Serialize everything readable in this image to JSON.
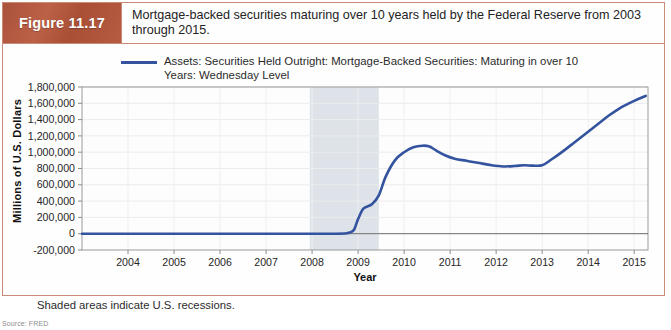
{
  "figure": {
    "badge_label": "Figure 11.17",
    "caption": "Mortgage-backed securities maturing over 10 years held by the Federal Reserve from 2003 through 2015.",
    "note": "Shaded areas indicate U.S. recessions.",
    "source": "Source: FRED",
    "accent_color": "#b0563c",
    "border_color": "#c98a78"
  },
  "chart_data": {
    "type": "line",
    "title": "",
    "xlabel": "Year",
    "ylabel": "Millions of U.S. Dollars",
    "legend": [
      "Assets: Securities Held Outright: Mortgage-Backed Securities: Maturing in over 10 Years: Wednesday Level"
    ],
    "legend_position": "top",
    "grid": true,
    "series_color": "#33539e",
    "xlim": [
      2003.0,
      2015.3
    ],
    "ylim": [
      -200000,
      1800000
    ],
    "ytick_step": 200000,
    "yticks": [
      1800000,
      1600000,
      1400000,
      1200000,
      1000000,
      800000,
      600000,
      400000,
      200000,
      0,
      -200000
    ],
    "ytick_labels": [
      "1,800,000",
      "1,600,000",
      "1,400,000",
      "1,200,000",
      "1,000,000",
      "800,000",
      "600,000",
      "400,000",
      "200,000",
      "0",
      "-200,000"
    ],
    "xticks": [
      2004,
      2005,
      2006,
      2007,
      2008,
      2009,
      2010,
      2011,
      2012,
      2013,
      2014,
      2015
    ],
    "xtick_labels": [
      "2004",
      "2005",
      "2006",
      "2007",
      "2008",
      "2009",
      "2010",
      "2011",
      "2012",
      "2013",
      "2014",
      "2015"
    ],
    "shaded_regions": [
      {
        "label": "U.S. recession",
        "x0": 2007.95,
        "x1": 2009.45,
        "color": "#dde3e8"
      }
    ],
    "series": [
      {
        "name": "Assets: Securities Held Outright: Mortgage-Backed Securities: Maturing in over 10 Years: Wednesday Level",
        "x": [
          2003.0,
          2004.0,
          2005.0,
          2006.0,
          2007.0,
          2008.0,
          2008.4,
          2008.75,
          2008.9,
          2009.0,
          2009.12,
          2009.3,
          2009.45,
          2009.6,
          2009.8,
          2010.0,
          2010.2,
          2010.4,
          2010.55,
          2010.7,
          2010.9,
          2011.1,
          2011.35,
          2011.6,
          2011.9,
          2012.15,
          2012.4,
          2012.6,
          2012.8,
          2013.0,
          2013.2,
          2013.45,
          2013.7,
          2013.95,
          2014.2,
          2014.45,
          2014.7,
          2015.0,
          2015.25
        ],
        "y": [
          0,
          0,
          0,
          0,
          0,
          0,
          0,
          5000,
          40000,
          180000,
          310000,
          360000,
          470000,
          700000,
          900000,
          1000000,
          1060000,
          1080000,
          1070000,
          1020000,
          960000,
          920000,
          895000,
          870000,
          840000,
          825000,
          830000,
          840000,
          835000,
          840000,
          910000,
          1010000,
          1120000,
          1230000,
          1340000,
          1450000,
          1545000,
          1630000,
          1690000
        ]
      }
    ]
  }
}
